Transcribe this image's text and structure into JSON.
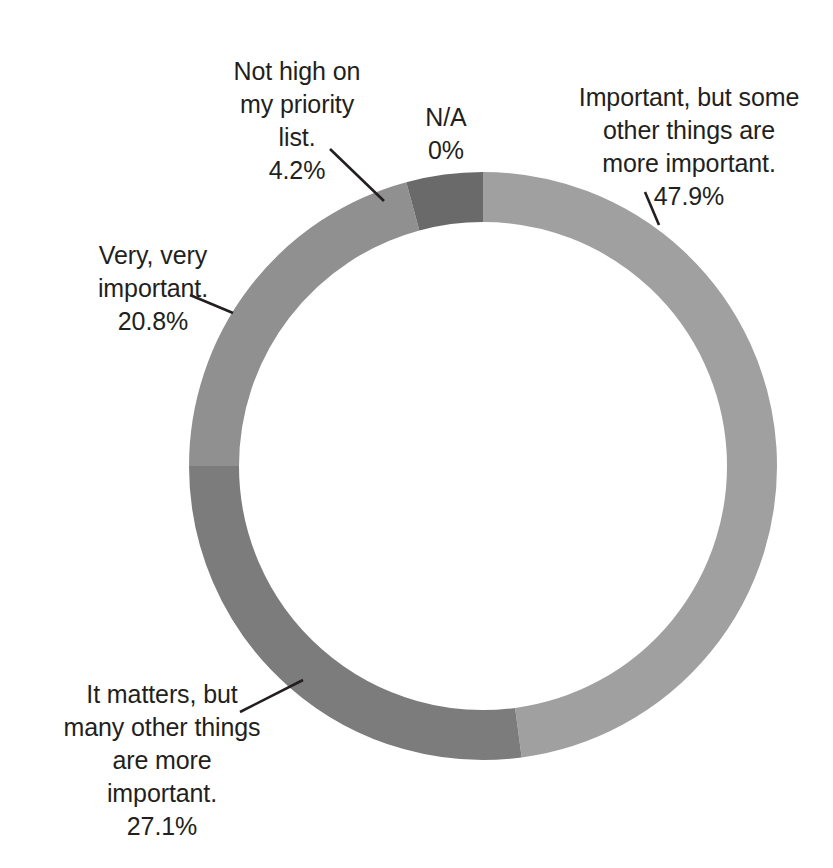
{
  "chart_data": {
    "type": "pie",
    "variant": "donut",
    "title": "",
    "subtitle": "",
    "xlabel": "",
    "ylabel": "",
    "legend_position": "none",
    "grid": false,
    "total_percent": 100,
    "start_angle_deg": 0,
    "direction": "clockwise",
    "center": {
      "x": 483,
      "y": 466
    },
    "outer_radius": 294,
    "inner_radius": 244,
    "categories": [
      "Important, but some other things are more important.",
      "It matters, but many other things are more important.",
      "Very, very important.",
      "Not high on my priority list.",
      "N/A"
    ],
    "values": [
      47.9,
      27.1,
      20.8,
      4.2,
      0
    ],
    "value_labels": [
      "47.9%",
      "27.1%",
      "20.8%",
      "4.2%",
      "0%"
    ],
    "colors": [
      "#a0a0a0",
      "#7c7c7c",
      "#909090",
      "#6a6a6a",
      "#bfbfbf"
    ],
    "slices": [
      {
        "name": "Important, but some other things are more important.",
        "label_lines": "Important, but some\nother things are\nmore important.",
        "value": 47.9,
        "value_label": "47.9%",
        "color": "#a0a0a0",
        "start_deg": 0,
        "end_deg": 172.44
      },
      {
        "name": "It matters, but many other things are more important.",
        "label_lines": "It matters, but\nmany other things\nare more\nimportant.",
        "value": 27.1,
        "value_label": "27.1%",
        "color": "#7c7c7c",
        "start_deg": 172.44,
        "end_deg": 270.0
      },
      {
        "name": "Very, very important.",
        "label_lines": "Very, very\nimportant.",
        "value": 20.8,
        "value_label": "20.8%",
        "color": "#909090",
        "start_deg": 270.0,
        "end_deg": 344.88
      },
      {
        "name": "Not high on my priority list.",
        "label_lines": "Not high on\nmy priority\nlist.",
        "value": 4.2,
        "value_label": "4.2%",
        "color": "#6a6a6a",
        "start_deg": 344.88,
        "end_deg": 360.0
      },
      {
        "name": "N/A",
        "label_lines": "N/A",
        "value": 0,
        "value_label": "0%",
        "color": "#bfbfbf",
        "start_deg": 360.0,
        "end_deg": 360.0
      }
    ]
  },
  "labels": {
    "na": {
      "text": "N/A",
      "percent": "0%"
    },
    "important": {
      "text": "Important, but some\nother things are\nmore important.",
      "percent": "47.9%"
    },
    "not_high": {
      "text": "Not high on\nmy priority\nlist.",
      "percent": "4.2%"
    },
    "very_very": {
      "text": "Very, very\nimportant.",
      "percent": "20.8%"
    },
    "it_matters": {
      "text": "It matters, but\nmany other things\nare more\nimportant.",
      "percent": "27.1%"
    }
  },
  "style": {
    "background": "#ffffff",
    "text_color": "#231f20",
    "leader_line_color": "#231f20"
  }
}
